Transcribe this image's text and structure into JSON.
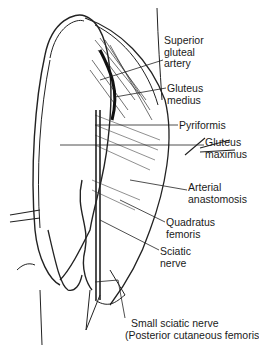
{
  "figure": {
    "labels": [
      {
        "id": "superior-gluteal-artery",
        "lines": [
          "Superior",
          "gluteal",
          "artery"
        ],
        "x": 164,
        "y": 35
      },
      {
        "id": "gluteus-medius",
        "lines": [
          "Gluteus",
          "medius"
        ],
        "x": 167,
        "y": 83
      },
      {
        "id": "pyriformis",
        "lines": [
          "Pyriformis"
        ],
        "x": 179,
        "y": 120
      },
      {
        "id": "gluteus-maximus",
        "lines": [
          "Gluteus",
          "maximus"
        ],
        "x": 205,
        "y": 137
      },
      {
        "id": "arterial-anastomosis",
        "lines": [
          "Arterial",
          "anastomosis"
        ],
        "x": 188,
        "y": 182
      },
      {
        "id": "quadratus-femoris",
        "lines": [
          "Quadratus",
          "femoris"
        ],
        "x": 166,
        "y": 217
      },
      {
        "id": "sciatic-nerve",
        "lines": [
          "Sciatic",
          "nerve"
        ],
        "x": 160,
        "y": 246
      },
      {
        "id": "small-sciatic-nerve",
        "lines": [
          "Small sciatic nerve",
          "(Posterior cutaneous femoris)"
        ],
        "x": 125,
        "y": 318
      }
    ]
  }
}
